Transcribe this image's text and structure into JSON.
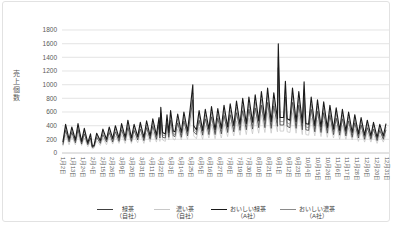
{
  "chart_data": {
    "type": "line",
    "ylabel": "売上個数",
    "legend_position": "bottom",
    "grid": true,
    "y_axis": {
      "max": 1800,
      "ticks": [
        0,
        200,
        400,
        600,
        800,
        1000,
        1200,
        1400,
        1600,
        1800
      ]
    },
    "x_axis": {
      "tick_labels": [
        "1月2日",
        "1月13日",
        "1月24日",
        "2月4日",
        "2月15日",
        "2月26日",
        "3月9日",
        "3月20日",
        "3月31日",
        "4月11日",
        "4月22日",
        "5月3日",
        "5月14日",
        "5月25日",
        "6月5日",
        "6月16日",
        "6月27日",
        "7月8日",
        "7月19日",
        "7月30日",
        "8月10日",
        "8月21日",
        "9月1日",
        "9月12日",
        "9月23日",
        "10月4日",
        "10月15日",
        "10月26日",
        "11月6日",
        "11月17日",
        "11月28日",
        "12月9日",
        "12月20日",
        "12月31日"
      ],
      "tick_days": [
        2,
        13,
        24,
        35,
        46,
        57,
        68,
        79,
        90,
        101,
        112,
        123,
        134,
        145,
        156,
        167,
        178,
        189,
        200,
        211,
        222,
        233,
        244,
        255,
        266,
        277,
        288,
        299,
        310,
        321,
        332,
        343,
        354,
        365
      ]
    },
    "days": [
      2,
      5,
      9,
      12,
      16,
      19,
      23,
      26,
      30,
      33,
      35,
      37,
      40,
      44,
      47,
      51,
      54,
      58,
      61,
      65,
      68,
      72,
      75,
      79,
      82,
      86,
      89,
      93,
      96,
      100,
      103,
      107,
      110,
      111,
      112,
      114,
      117,
      119,
      121,
      123,
      126,
      128,
      131,
      135,
      138,
      142,
      145,
      148,
      149,
      152,
      155,
      159,
      162,
      166,
      169,
      173,
      176,
      180,
      183,
      187,
      190,
      194,
      197,
      201,
      204,
      208,
      211,
      215,
      218,
      222,
      225,
      229,
      232,
      236,
      239,
      243,
      244,
      246,
      250,
      252,
      254,
      257,
      260,
      264,
      267,
      271,
      273,
      275,
      278,
      281,
      285,
      288,
      292,
      295,
      299,
      302,
      306,
      309,
      313,
      316,
      320,
      323,
      327,
      330,
      334,
      337,
      341,
      344,
      348,
      351,
      355,
      358,
      362,
      365
    ],
    "series": [
      {
        "name": "緑茶",
        "company": "（自社）",
        "color": "#404040",
        "values": [
          120,
          330,
          160,
          300,
          150,
          340,
          130,
          280,
          120,
          220,
          80,
          90,
          230,
          140,
          270,
          160,
          300,
          160,
          310,
          170,
          340,
          180,
          370,
          170,
          330,
          190,
          350,
          180,
          370,
          200,
          390,
          200,
          410,
          220,
          520,
          230,
          220,
          440,
          230,
          480,
          250,
          240,
          440,
          230,
          470,
          250,
          510,
          780,
          310,
          270,
          480,
          260,
          500,
          270,
          530,
          270,
          510,
          280,
          550,
          300,
          560,
          310,
          590,
          330,
          620,
          340,
          640,
          350,
          660,
          370,
          700,
          370,
          740,
          360,
          690,
          390,
          1250,
          410,
          410,
          820,
          390,
          370,
          740,
          360,
          700,
          340,
          810,
          340,
          330,
          640,
          310,
          610,
          300,
          590,
          290,
          550,
          270,
          510,
          260,
          500,
          250,
          470,
          230,
          440,
          220,
          410,
          200,
          370,
          200,
          350,
          180,
          330,
          200,
          340
        ]
      },
      {
        "name": "濃い茶",
        "company": "（自社）",
        "color": "#c8c8c8",
        "values": [
          100,
          260,
          120,
          240,
          120,
          270,
          110,
          220,
          90,
          170,
          60,
          70,
          180,
          110,
          220,
          120,
          240,
          130,
          250,
          140,
          270,
          140,
          300,
          140,
          260,
          150,
          280,
          140,
          290,
          160,
          310,
          160,
          320,
          170,
          420,
          190,
          170,
          350,
          190,
          380,
          200,
          190,
          350,
          190,
          370,
          200,
          400,
          620,
          250,
          210,
          380,
          200,
          400,
          220,
          420,
          210,
          400,
          220,
          430,
          240,
          450,
          250,
          470,
          260,
          500,
          270,
          510,
          280,
          530,
          290,
          560,
          300,
          590,
          290,
          550,
          310,
          990,
          320,
          320,
          650,
          310,
          300,
          590,
          290,
          560,
          270,
          640,
          270,
          260,
          510,
          250,
          480,
          240,
          470,
          230,
          430,
          220,
          410,
          200,
          400,
          200,
          370,
          190,
          350,
          170,
          320,
          160,
          300,
          160,
          280,
          140,
          260,
          160,
          270
        ]
      },
      {
        "name": "おいしい緑茶",
        "company": "（A社）",
        "color": "#1a1a1a",
        "values": [
          160,
          420,
          200,
          380,
          190,
          430,
          170,
          360,
          150,
          280,
          100,
          110,
          290,
          180,
          350,
          200,
          380,
          210,
          400,
          220,
          430,
          230,
          480,
          220,
          420,
          240,
          450,
          230,
          470,
          250,
          500,
          260,
          520,
          280,
          670,
          300,
          280,
          560,
          300,
          620,
          320,
          310,
          570,
          300,
          600,
          320,
          650,
          1000,
          400,
          340,
          620,
          330,
          640,
          350,
          680,
          340,
          650,
          360,
          700,
          380,
          720,
          400,
          760,
          420,
          800,
          430,
          820,
          450,
          850,
          470,
          900,
          480,
          950,
          460,
          880,
          500,
          1600,
          520,
          520,
          1050,
          500,
          480,
          950,
          460,
          900,
          440,
          1040,
          430,
          420,
          820,
          400,
          780,
          380,
          750,
          370,
          700,
          350,
          660,
          330,
          640,
          320,
          600,
          300,
          560,
          280,
          520,
          260,
          480,
          250,
          450,
          230,
          420,
          250,
          430
        ]
      },
      {
        "name": "おいしい濃茶",
        "company": "（A社）",
        "color": "#8a8a8a",
        "values": [
          140,
          370,
          180,
          330,
          170,
          380,
          150,
          320,
          130,
          250,
          90,
          100,
          260,
          160,
          310,
          180,
          330,
          180,
          350,
          190,
          380,
          200,
          420,
          190,
          370,
          210,
          400,
          200,
          410,
          220,
          440,
          230,
          460,
          250,
          590,
          260,
          250,
          490,
          260,
          550,
          280,
          270,
          500,
          260,
          530,
          280,
          570,
          880,
          350,
          300,
          550,
          290,
          560,
          310,
          600,
          300,
          570,
          320,
          620,
          330,
          630,
          350,
          670,
          370,
          700,
          380,
          720,
          400,
          750,
          410,
          790,
          420,
          840,
          400,
          770,
          440,
          1410,
          460,
          460,
          920,
          440,
          420,
          840,
          400,
          790,
          390,
          920,
          380,
          370,
          720,
          350,
          690,
          330,
          660,
          330,
          620,
          310,
          580,
          290,
          560,
          280,
          530,
          260,
          490,
          250,
          460,
          230,
          420,
          220,
          400,
          200,
          370,
          220,
          380
        ]
      }
    ],
    "colors": {
      "gridline": "#d9d9d9",
      "axis_line": "#bfbfbf",
      "axis_label": "#595959"
    }
  }
}
